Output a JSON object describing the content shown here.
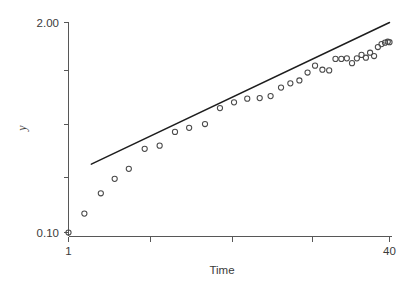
{
  "chart_data": {
    "type": "scatter",
    "title": "",
    "subtitle": "",
    "xlabel": "Time",
    "ylabel": "y",
    "xscale": "log",
    "yscale": "log",
    "xlim": [
      1,
      40
    ],
    "ylim": [
      0.1,
      2.0
    ],
    "grid": false,
    "legend": false,
    "x_tick_labels": [
      "1",
      "40"
    ],
    "y_tick_labels": [
      "2.00",
      "0.10"
    ],
    "x_ticks_unlabeled_count": 3,
    "y_ticks_unlabeled_count": 3,
    "marker": "open-circle",
    "series": [
      {
        "name": "observed",
        "type": "scatter",
        "x": [
          1.0,
          1.2,
          1.45,
          1.7,
          2.0,
          2.4,
          2.85,
          3.4,
          4.0,
          4.8,
          5.7,
          6.7,
          7.8,
          9.0,
          10.2,
          11.5,
          12.8,
          14.2,
          15.6,
          17.0,
          18.5,
          20.0,
          21.5,
          23.0,
          24.5,
          26.0,
          27.5,
          29.0,
          30.5,
          32.0,
          33.5,
          35.0,
          36.5,
          38.0,
          39.2,
          40.0
        ],
        "y": [
          0.1,
          0.131,
          0.175,
          0.215,
          0.248,
          0.33,
          0.345,
          0.42,
          0.445,
          0.47,
          0.59,
          0.64,
          0.675,
          0.68,
          0.7,
          0.79,
          0.84,
          0.875,
          0.98,
          1.08,
          1.02,
          1.01,
          1.19,
          1.19,
          1.2,
          1.12,
          1.2,
          1.26,
          1.21,
          1.3,
          1.24,
          1.41,
          1.47,
          1.5,
          1.52,
          1.51
        ]
      },
      {
        "name": "fitted-line",
        "type": "line",
        "x": [
          1.3,
          40.0
        ],
        "y": [
          0.265,
          2.0
        ]
      }
    ],
    "annotations": []
  },
  "axes": {
    "y_top_label": "2.00",
    "y_bottom_label": "0.10",
    "x_left_label": "1",
    "x_right_label": "40",
    "x_axis_title": "Time",
    "y_axis_title": "y"
  },
  "colors": {
    "background": "#ffffff",
    "axis": "#575757",
    "text": "#3a3a3a",
    "line": "#1d1d1d",
    "marker": "#4a4a4a"
  }
}
